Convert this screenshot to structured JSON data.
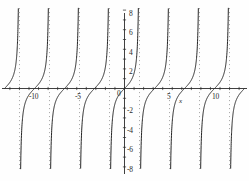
{
  "figure": {
    "title": "",
    "background": "#fefefe",
    "width": 249,
    "height": 181
  },
  "axes": {
    "x_axis_label": "x",
    "y_axis_label": "",
    "x_tick_labels": [
      "-10",
      "-5",
      "0",
      "5",
      "10"
    ],
    "y_tick_labels": [
      "8",
      "6",
      "4",
      "2",
      "0",
      "-2",
      "-4",
      "-6",
      "-8"
    ],
    "curve_color": "#1a1a1a",
    "asymptote_color": "#8a8a8a",
    "axis_color": "#2a2a2a"
  },
  "chart_data": {
    "type": "line",
    "title": "",
    "xlabel": "x",
    "ylabel": "",
    "xlim": [
      -13.1,
      13.1
    ],
    "ylim": [
      -8,
      8
    ],
    "grid": false,
    "legend": null,
    "function": "y = tan(x)",
    "x_ticks": [
      -10,
      -5,
      0,
      5,
      10
    ],
    "y_ticks": [
      8,
      6,
      4,
      2,
      0,
      -2,
      -4,
      -6,
      -8
    ],
    "x_tick_labels": [
      "-10",
      "-5",
      "0",
      "5",
      "10"
    ],
    "y_tick_labels": [
      "8",
      "6",
      "4",
      "2",
      "0",
      "-2",
      "-4",
      "-6",
      "-8"
    ],
    "zero_crossings": [
      -12.566,
      -9.425,
      -6.283,
      -3.142,
      0,
      3.142,
      6.283,
      9.425,
      12.566
    ],
    "asymptotes": [
      -10.996,
      -7.854,
      -4.712,
      -1.571,
      1.571,
      4.712,
      7.854,
      10.996
    ],
    "asymptote_style": "dotted",
    "series": [
      {
        "name": "tan(x)",
        "style": "solid",
        "branches": [
          {
            "x_range": [
              -12.566,
              -10.996
            ]
          },
          {
            "x_range": [
              -10.996,
              -7.854
            ]
          },
          {
            "x_range": [
              -7.854,
              -4.712
            ]
          },
          {
            "x_range": [
              -4.712,
              -1.571
            ]
          },
          {
            "x_range": [
              -1.571,
              1.571
            ]
          },
          {
            "x_range": [
              1.571,
              4.712
            ]
          },
          {
            "x_range": [
              4.712,
              7.854
            ]
          },
          {
            "x_range": [
              7.854,
              10.996
            ]
          },
          {
            "x_range": [
              10.996,
              12.566
            ]
          }
        ]
      }
    ]
  }
}
